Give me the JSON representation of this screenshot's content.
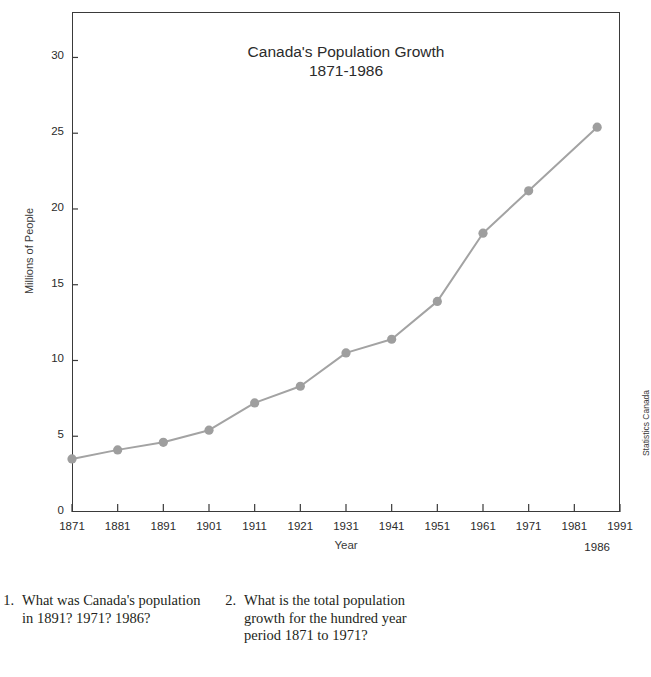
{
  "chart_data": {
    "type": "line",
    "title": "Canada's Population Growth",
    "subtitle": "1871-1986",
    "xlabel": "Year",
    "ylabel": "Millions of People",
    "x": [
      1871,
      1881,
      1891,
      1901,
      1911,
      1921,
      1931,
      1941,
      1951,
      1961,
      1971,
      1986
    ],
    "values": [
      3.5,
      4.1,
      4.6,
      5.4,
      7.2,
      8.3,
      10.5,
      11.4,
      13.9,
      18.4,
      21.2,
      25.4
    ],
    "series": [
      {
        "name": "Canada population",
        "values": [
          3.5,
          4.1,
          4.6,
          5.4,
          7.2,
          8.3,
          10.5,
          11.4,
          13.9,
          18.4,
          21.2,
          25.4
        ]
      }
    ],
    "xlim": [
      1871,
      1991
    ],
    "ylim": [
      0,
      33
    ],
    "xticks": [
      1871,
      1881,
      1891,
      1901,
      1911,
      1921,
      1931,
      1941,
      1951,
      1961,
      1971,
      1981,
      1991
    ],
    "xtick_labels": [
      "1871",
      "1881",
      "1891",
      "1901",
      "1911",
      "1921",
      "1931",
      "1941",
      "1951",
      "1961",
      "1971",
      "1981",
      "1991"
    ],
    "extra_xtick_label": "1986",
    "yticks": [
      0,
      5,
      10,
      15,
      20,
      25,
      30
    ],
    "ytick_labels": [
      "0",
      "5",
      "10",
      "15",
      "20",
      "25",
      "30"
    ],
    "grid": false,
    "legend": "none",
    "source": "Statistics Canada",
    "line_color": "#a3a3a3",
    "marker_color": "#9e9e9e",
    "frame_color": "#3a3a3a"
  },
  "questions": [
    {
      "number": "1.",
      "text": "What was Canada's population in 1891? 1971? 1986?"
    },
    {
      "number": "2.",
      "text": "What is the total population growth for the hundred year period 1871 to 1971?"
    }
  ]
}
